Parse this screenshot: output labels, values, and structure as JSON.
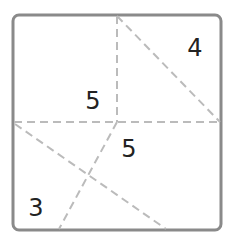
{
  "diagram": {
    "type": "square-partition-puzzle",
    "colors": {
      "border": "#8a8a8a",
      "dashed_line": "#bbbbbb",
      "label": "#222222",
      "background": "#ffffff"
    },
    "square": {
      "x": 13,
      "y": 15,
      "width": 208,
      "height": 215,
      "corner_radius": 6
    },
    "lines": [
      {
        "id": "vertical-top",
        "x1": 117,
        "y1": 16,
        "x2": 117,
        "y2": 122
      },
      {
        "id": "diagonal-top-right",
        "x1": 117,
        "y1": 16,
        "x2": 220,
        "y2": 122
      },
      {
        "id": "horizontal-middle",
        "x1": 14,
        "y1": 122,
        "x2": 220,
        "y2": 122
      },
      {
        "id": "diagonal-lower",
        "x1": 15,
        "y1": 124,
        "x2": 166,
        "y2": 229
      },
      {
        "id": "slant-lower",
        "x1": 117,
        "y1": 122,
        "x2": 59,
        "y2": 229
      }
    ],
    "labels": [
      {
        "id": "region-top-right",
        "text": "4",
        "x": 195,
        "y": 56
      },
      {
        "id": "region-top-left",
        "text": "5",
        "x": 93,
        "y": 109
      },
      {
        "id": "region-middle-right",
        "text": "5",
        "x": 129,
        "y": 157
      },
      {
        "id": "region-bottom-left",
        "text": "3",
        "x": 36,
        "y": 216
      }
    ]
  }
}
